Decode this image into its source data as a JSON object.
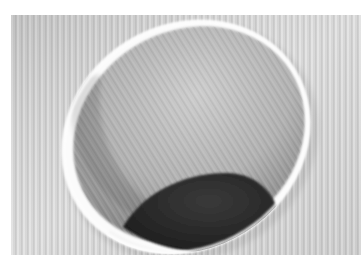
{
  "image": {
    "alt": "White cup viewed from above at an angle with dark contents at the bottom, on a ribbed light gray surface",
    "subject": "cup",
    "colors": {
      "border": "#ffffff",
      "background_surface": "#d6d6d6",
      "rib_light": "#e2e2e2",
      "rib_dark": "#c9c9c9",
      "cup_rim": "#fbfbfb",
      "cup_interior_light": "#c4c4c4",
      "cup_interior_dark": "#8f8f8f",
      "contents": "#2b2b2b"
    }
  }
}
